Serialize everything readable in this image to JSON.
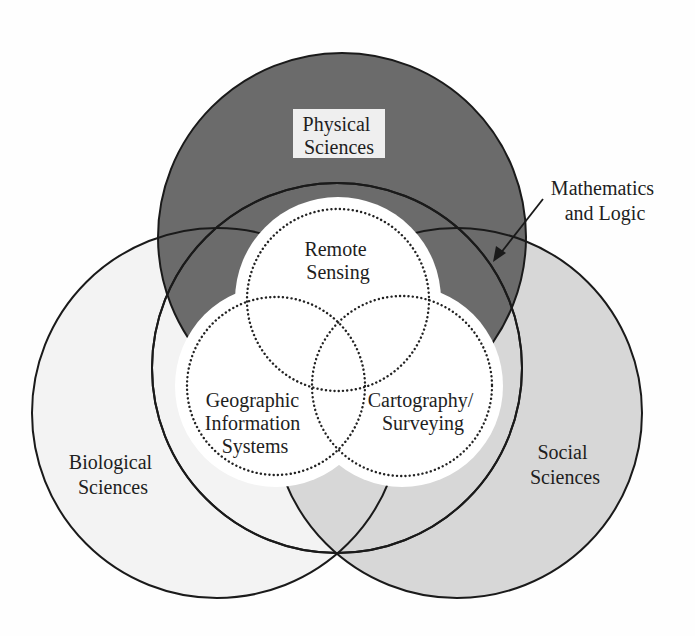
{
  "diagram": {
    "type": "venn",
    "colors": {
      "physical": "#6b6b6b",
      "social": "#d7d7d7",
      "biological": "#f3f3f3",
      "core": "#ffffff",
      "outline": "#1a1a1a",
      "label_box": "#efefef"
    },
    "outer_sets": [
      {
        "id": "physical",
        "lines": [
          "Physical",
          "Sciences"
        ]
      },
      {
        "id": "biological",
        "lines": [
          "Biological",
          "Sciences"
        ]
      },
      {
        "id": "social",
        "lines": [
          "Social",
          "Sciences"
        ]
      },
      {
        "id": "math",
        "lines": [
          "Mathematics",
          "and Logic"
        ]
      }
    ],
    "inner_sets": [
      {
        "id": "remote-sensing",
        "lines": [
          "Remote",
          "Sensing"
        ]
      },
      {
        "id": "gis",
        "lines": [
          "Geographic",
          "Information",
          "Systems"
        ]
      },
      {
        "id": "cartography",
        "lines": [
          "Cartography/",
          "Surveying"
        ]
      }
    ]
  }
}
